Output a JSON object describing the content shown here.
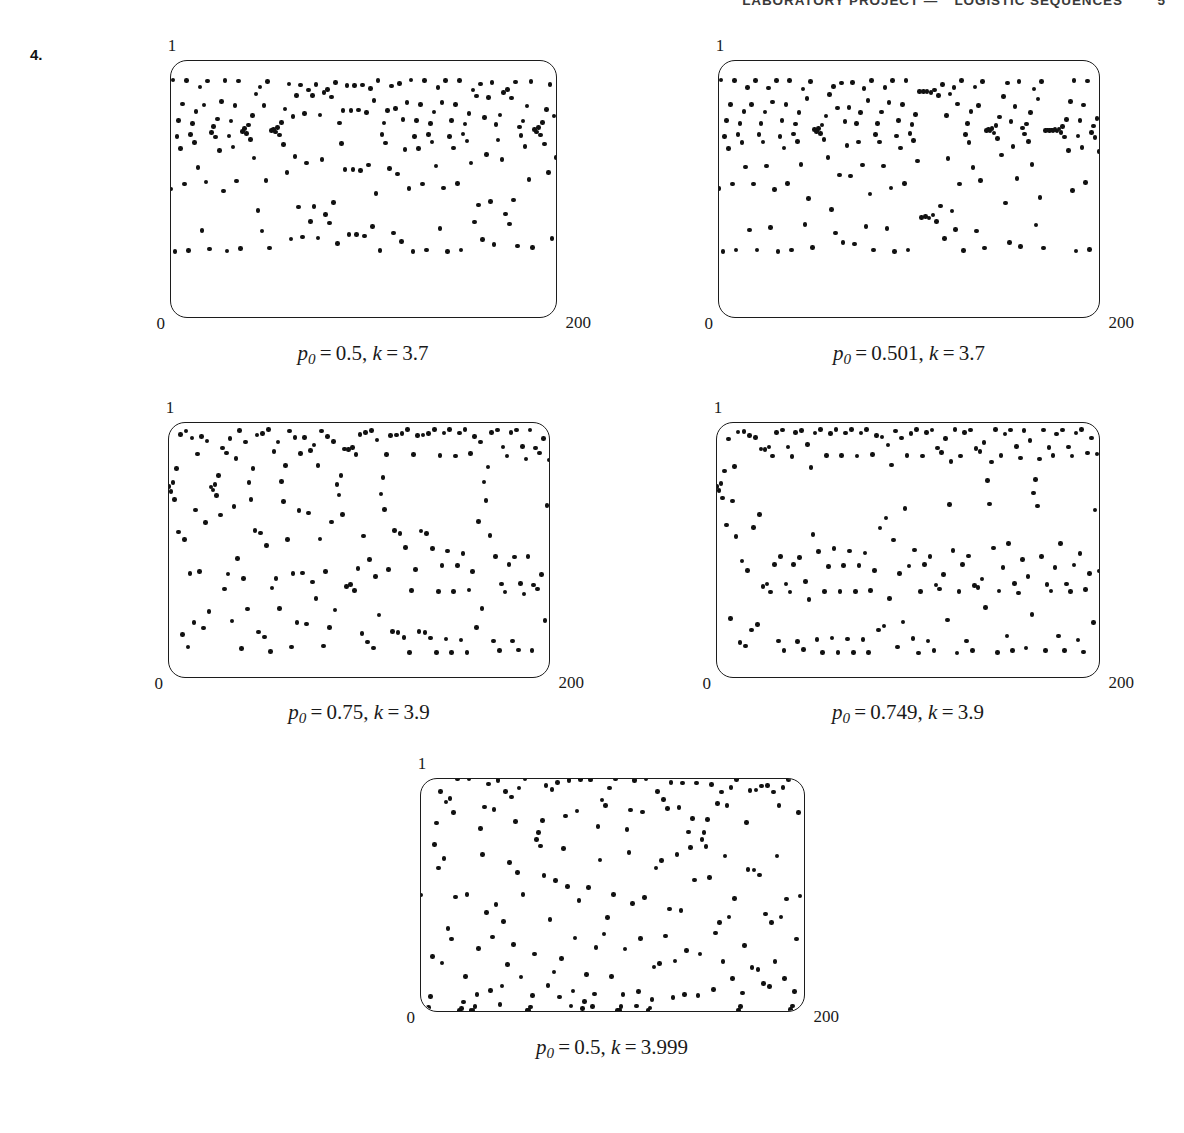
{
  "header": {
    "title": "LABORATORY PROJECT",
    "separator": "—",
    "subtitle": "LOGISTIC SEQUENCES",
    "page_number": "5"
  },
  "exercise": {
    "number": "4."
  },
  "axes": {
    "y_max": "1",
    "x_min": "0",
    "x_max": "200"
  },
  "figures": [
    {
      "id": "figure-1",
      "caption": "p0 = 0.5, k = 3.7",
      "p0_label": "p",
      "p0_sub": "0",
      "p0_value": "0.5",
      "k_label": "k",
      "k_value": "3.7",
      "p0": 0.5,
      "k": 3.7,
      "n": 200
    },
    {
      "id": "figure-2",
      "caption": "p0 = 0.501, k = 3.7",
      "p0_label": "p",
      "p0_sub": "0",
      "p0_value": "0.501",
      "k_label": "k",
      "k_value": "3.7",
      "p0": 0.501,
      "k": 3.7,
      "n": 200
    },
    {
      "id": "figure-3",
      "caption": "p0 = 0.75, k = 3.9",
      "p0_label": "p",
      "p0_sub": "0",
      "p0_value": "0.75",
      "k_label": "k",
      "k_value": "3.9",
      "p0": 0.75,
      "k": 3.9,
      "n": 200
    },
    {
      "id": "figure-4",
      "caption": "p0 = 0.749, k = 3.9",
      "p0_label": "p",
      "p0_sub": "0",
      "p0_value": "0.749",
      "k_label": "k",
      "k_value": "3.9",
      "p0": 0.749,
      "k": 3.9,
      "n": 200
    },
    {
      "id": "figure-5",
      "caption": "p0 = 0.5, k = 3.999",
      "p0_label": "p",
      "p0_sub": "0",
      "p0_value": "0.5",
      "k_label": "k",
      "k_value": "3.999",
      "p0": 0.5,
      "k": 3.999,
      "n": 200
    }
  ],
  "chart_data": {
    "type": "scatter",
    "xlabel": "n",
    "ylabel": "p",
    "xlim": [
      0,
      200
    ],
    "ylim": [
      0,
      1
    ],
    "grid": false,
    "legend": "none",
    "panels": [
      {
        "name": "p0 = 0.5, k = 3.7",
        "p0": 0.5,
        "k": 3.7,
        "points": 200
      },
      {
        "name": "p0 = 0.501, k = 3.7",
        "p0": 0.501,
        "k": 3.7,
        "points": 200
      },
      {
        "name": "p0 = 0.75, k = 3.9",
        "p0": 0.75,
        "k": 3.9,
        "points": 200
      },
      {
        "name": "p0 = 0.749, k = 3.9",
        "p0": 0.749,
        "k": 3.9,
        "points": 200
      },
      {
        "name": "p0 = 0.5, k = 3.999",
        "p0": 0.5,
        "k": 3.999,
        "points": 200
      }
    ]
  },
  "layout": {
    "panels": [
      {
        "left": 170,
        "top": 60,
        "width": 387,
        "height": 258,
        "caption_cx": 363,
        "caption_y": 341
      },
      {
        "left": 718,
        "top": 60,
        "width": 382,
        "height": 258,
        "caption_cx": 909,
        "caption_y": 341
      },
      {
        "left": 168,
        "top": 422,
        "width": 382,
        "height": 256,
        "caption_cx": 359,
        "caption_y": 700
      },
      {
        "left": 716,
        "top": 422,
        "width": 384,
        "height": 256,
        "caption_cx": 908,
        "caption_y": 700
      },
      {
        "left": 420,
        "top": 778,
        "width": 385,
        "height": 234,
        "caption_cx": 612,
        "caption_y": 1035
      }
    ]
  }
}
